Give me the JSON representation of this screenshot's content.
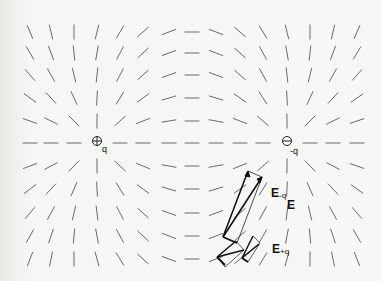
{
  "diagram": {
    "title": "",
    "type": "electric-dipole-field-direction",
    "grid": {
      "columns_x": [
        30,
        51,
        74,
        97,
        120,
        143,
        169,
        192,
        216,
        240,
        263,
        287,
        310,
        333,
        357
      ],
      "rows_y": [
        32,
        53,
        75,
        98,
        121,
        143,
        166,
        189,
        213,
        236,
        259
      ],
      "segment_length": 15,
      "segment_color": "#6a6a6a"
    },
    "charges": [
      {
        "id": "positive",
        "x": 97,
        "y": 143,
        "q": 1,
        "symbol": "⊕",
        "label": "q"
      },
      {
        "id": "negative",
        "x": 287,
        "y": 143,
        "q": -1,
        "symbol": "⊖",
        "label": "-q"
      }
    ],
    "vector_labels": {
      "e_minus_q": {
        "main": "E",
        "sub": "-q"
      },
      "e_total": {
        "main": "E",
        "sub": ""
      },
      "e_plus_q": {
        "main": "E",
        "sub": "+q"
      }
    },
    "parallelograms": [
      {
        "origin": [
          226,
          238
        ],
        "e_plus": [
          280,
          187
        ],
        "e_minus": [
          264,
          234
        ],
        "sum": [
          272,
          197
        ]
      }
    ],
    "parallelograms_raw": [
      {
        "points": [
          [
            226,
            238
          ],
          [
            241,
            233
          ],
          [
            257,
            193
          ],
          [
            283,
            181
          ],
          [
            264,
            234
          ]
        ],
        "note": "large"
      },
      {
        "points": [
          [
            217,
            258
          ],
          [
            233,
            235
          ],
          [
            243,
            238
          ],
          [
            229,
            262
          ]
        ],
        "note": "small-left"
      },
      {
        "points": [
          [
            240,
            259
          ],
          [
            253,
            236
          ],
          [
            260,
            240
          ],
          [
            252,
            262
          ]
        ],
        "note": "small-mid"
      }
    ]
  }
}
